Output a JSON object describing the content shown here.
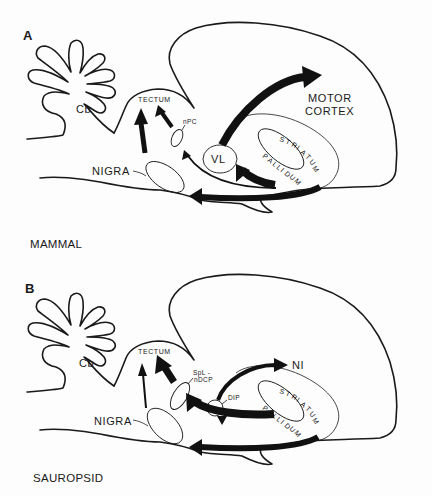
{
  "figure": {
    "panels": [
      {
        "id": "A",
        "species_label": "MAMMAL",
        "labels": {
          "cerebellum": "Cb",
          "tectum": "TECTUM",
          "npc": "nPC",
          "nigra": "NIGRA",
          "vl": "VL",
          "target": "MOTOR",
          "target2": "CORTEX",
          "striatum": [
            "S",
            "T",
            "R",
            "I",
            "A",
            "T",
            "U",
            "M"
          ],
          "pallidum": [
            "P",
            "A",
            "L",
            "L",
            "I",
            "D",
            "U",
            "M"
          ]
        },
        "pathways": [
          {
            "from": "NIGRA",
            "to": "TECTUM",
            "weight": "heavy"
          },
          {
            "from": "nPC",
            "to": "TECTUM",
            "weight": "medium"
          },
          {
            "from": "PALLIDUM",
            "to": "nPC",
            "weight": "thin"
          },
          {
            "from": "PALLIDUM",
            "to": "VL",
            "weight": "heavy"
          },
          {
            "from": "STRIATUM",
            "to": "NIGRA",
            "weight": "heavy"
          },
          {
            "from": "VL",
            "to": "MOTOR CORTEX",
            "weight": "heavy"
          }
        ]
      },
      {
        "id": "B",
        "species_label": "SAUROPSID",
        "labels": {
          "cerebellum": "Cb",
          "tectum": "TECTUM",
          "spl1": "SpL -",
          "spl2": "nDCP",
          "nigra": "NIGRA",
          "dip": "DIP",
          "target": "NI",
          "striatum": [
            "S",
            "T",
            "R",
            "I",
            "A",
            "T",
            "U",
            "M"
          ],
          "pallidum": [
            "P",
            "A",
            "L",
            "L",
            "I",
            "D",
            "U",
            "M"
          ]
        },
        "pathways": [
          {
            "from": "NIGRA",
            "to": "TECTUM",
            "weight": "thin"
          },
          {
            "from": "SpL-nDCP",
            "to": "TECTUM",
            "weight": "heavy"
          },
          {
            "from": "PALLIDUM",
            "to": "SpL-nDCP",
            "weight": "heavy"
          },
          {
            "from": "PALLIDUM",
            "to": "DIP",
            "weight": "thin"
          },
          {
            "from": "STRIATUM",
            "to": "NIGRA",
            "weight": "heavy"
          },
          {
            "from": "DIP",
            "to": "NI",
            "weight": "medium"
          }
        ]
      }
    ]
  }
}
